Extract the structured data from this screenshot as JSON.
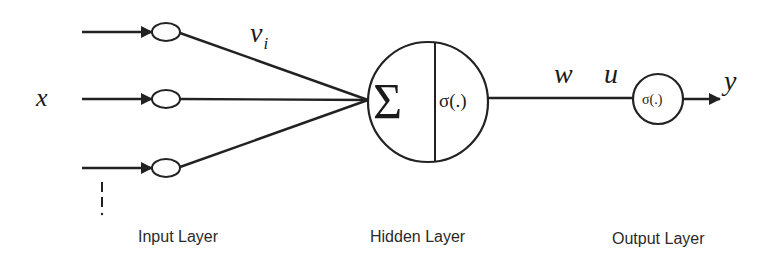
{
  "diagram": {
    "type": "single-hidden-neuron network",
    "colors": {
      "stroke": "#222222",
      "background": "#ffffff",
      "text": "#1a1a1a"
    },
    "input": {
      "symbol": "x",
      "weight_label": "v",
      "weight_subscript": "i",
      "continuation": "⋮",
      "layer_label": "Input Layer",
      "nodes": 3
    },
    "hidden": {
      "sum_symbol": "Σ",
      "activation": "σ(.)",
      "layer_label": "Hidden Layer"
    },
    "connection": {
      "weight_label": "w",
      "net_label": "u"
    },
    "output": {
      "activation": "σ(.)",
      "symbol": "y",
      "layer_label": "Output Layer"
    }
  }
}
